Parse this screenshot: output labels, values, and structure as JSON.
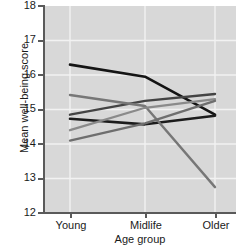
{
  "chart_data": {
    "type": "line",
    "title": "",
    "xlabel": "Age group",
    "ylabel": "Mean well-being score",
    "categories": [
      "Young",
      "Midlife",
      "Older"
    ],
    "x": [
      0,
      1,
      2
    ],
    "ylim": [
      12,
      18
    ],
    "yticks": [
      12,
      13,
      14,
      15,
      16,
      17,
      18
    ],
    "ytick_labels": [
      "12",
      "13",
      "14",
      "15",
      "16",
      "17",
      "18"
    ],
    "grid": true,
    "grid_color": "#f2f2f2",
    "plot_background": "#d8d8d8",
    "legend": "none",
    "series": [
      {
        "name": "series-1",
        "color": "#141414",
        "width": 2.6,
        "values": [
          16.3,
          15.95,
          14.85
        ]
      },
      {
        "name": "series-2",
        "color": "#1c1c1c",
        "width": 2.6,
        "values": [
          14.73,
          14.57,
          14.82
        ]
      },
      {
        "name": "series-3",
        "color": "#444444",
        "width": 2.4,
        "values": [
          14.85,
          15.25,
          15.45
        ]
      },
      {
        "name": "series-4",
        "color": "#777777",
        "width": 2.4,
        "values": [
          15.42,
          15.1,
          12.75
        ]
      },
      {
        "name": "series-5",
        "color": "#8a8a8a",
        "width": 2.3,
        "values": [
          14.4,
          15.05,
          15.3
        ]
      },
      {
        "name": "series-6",
        "color": "#6e6e6e",
        "width": 2.3,
        "values": [
          14.1,
          14.6,
          15.25
        ]
      }
    ]
  },
  "axes": {
    "y_title": "Mean well-being score",
    "x_title": "Age group",
    "y_labels": [
      "18",
      "17",
      "16",
      "15",
      "14",
      "13",
      "12"
    ],
    "x_labels": [
      "Young",
      "Midlife",
      "Older"
    ]
  }
}
